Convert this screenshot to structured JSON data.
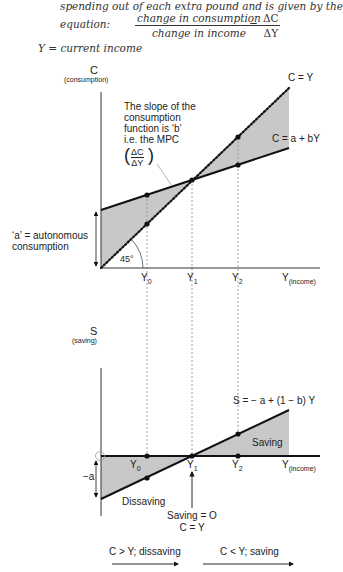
{
  "intro": {
    "line1": "spending out of each extra pound and is given by the",
    "equation_label": "equation:",
    "fraction_numerator": "change in consumption",
    "fraction_denominator": "change in income",
    "equals": "=",
    "delta_numerator": "ΔC",
    "delta_denominator": "ΔY",
    "y_definition": "Y = current income"
  },
  "upper_graph": {
    "y_axis_label": "C",
    "y_axis_sublabel": "(consumption)",
    "x_axis_label": "Y",
    "x_axis_sublabel": "(income)",
    "line_45_label": "C = Y",
    "consumption_function_label": "C = a + bY",
    "slope_note_lines": [
      "The slope of the",
      "consumption",
      "function is ‘b’",
      "i.e. the MPC"
    ],
    "slope_fraction_num": "ΔC",
    "slope_fraction_den": "ΔY",
    "autonomous_label_lines": [
      "‘a’ = autonomous",
      "consumption"
    ],
    "angle_label": "45°",
    "tick_labels": [
      "Y",
      "Y",
      "Y"
    ],
    "tick_subscripts": [
      "0",
      "1",
      "2"
    ]
  },
  "lower_graph": {
    "y_axis_label": "S",
    "y_axis_sublabel": "(saving)",
    "x_axis_label": "Y",
    "x_axis_sublabel": "(income)",
    "saving_function_label": "S = − a + (1 − b) Y",
    "saving_region_label": "Saving",
    "dissaving_region_label": "Dissaving",
    "intercept_label": "−a",
    "tick_labels": [
      "Y",
      "Y",
      "Y"
    ],
    "tick_subscripts": [
      "0",
      "1",
      "2"
    ],
    "breakeven_label_lines": [
      "Saving = O",
      "C = Y"
    ]
  },
  "bottom_arrows": {
    "left_label": "C > Y; dissaving",
    "right_label": "C < Y; saving"
  },
  "colors": {
    "shade": "#c8c8c8",
    "line": "#111111",
    "dashed": "#888888"
  }
}
